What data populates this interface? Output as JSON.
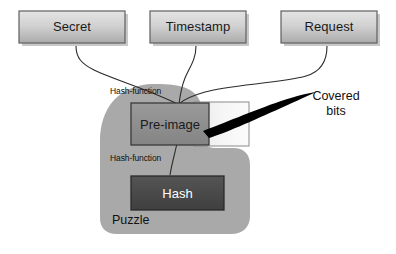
{
  "diagram": {
    "inputs": [
      {
        "id": "secret",
        "label": "Secret"
      },
      {
        "id": "timestamp",
        "label": "Timestamp"
      },
      {
        "id": "request",
        "label": "Request"
      }
    ],
    "nodes": [
      {
        "id": "pre-image",
        "label": "Pre-image"
      },
      {
        "id": "hash",
        "label": "Hash"
      }
    ],
    "edge_labels": [
      {
        "id": "hash-function-upper",
        "label": "Hash-function"
      },
      {
        "id": "hash-function-lower",
        "label": "Hash-function"
      }
    ],
    "region_label": "Puzzle",
    "annotation": {
      "id": "covered-bits",
      "line1": "Covered",
      "line2": "bits"
    },
    "colors": {
      "input_box_fill_light": "#dcdcdc",
      "input_box_fill_dark": "#b4b4b4",
      "input_box_border": "#6b6b6b",
      "input_box_shadow": "#9a9a9a",
      "puzzle_fill": "#a9a9a9",
      "preimage_fill": "#8e8e8e",
      "preimage_border": "#3a3a3a",
      "covered_fill": "#f2f2f2",
      "covered_border": "#8a8a8a",
      "hash_fill": "#4a4a4a",
      "hash_border": "#2a2a2a",
      "connector_stroke": "#2b2b2b",
      "arrow_fill": "#000000",
      "page_background": "#ffffff"
    }
  }
}
